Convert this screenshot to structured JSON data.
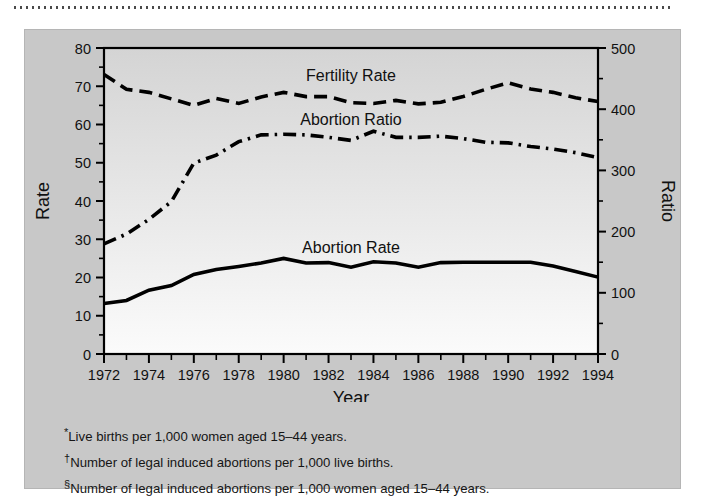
{
  "figure": {
    "panel_color": "#c8c8c8",
    "plot_gradient_top": "#d4d4d4",
    "plot_gradient_bottom": "#fbfbfb",
    "line_color": "#000000"
  },
  "footnotes": [
    {
      "marker": "*",
      "text": "Live births per 1,000 women aged 15–44 years."
    },
    {
      "marker": "†",
      "text": "Number of legal induced abortions per 1,000 live births."
    },
    {
      "marker": "§",
      "text": "Number of legal induced abortions per 1,000 women aged 15–44 years."
    }
  ],
  "chart_data": {
    "type": "line",
    "title": "",
    "xlabel": "Year",
    "ylabel": "Rate",
    "y2label": "Ratio",
    "xlim": [
      1972,
      1994
    ],
    "ylim": [
      0,
      80
    ],
    "y2lim": [
      0,
      500
    ],
    "grid": false,
    "legend": "inline-labels",
    "x": [
      1972,
      1973,
      1974,
      1975,
      1976,
      1977,
      1978,
      1979,
      1980,
      1981,
      1982,
      1983,
      1984,
      1985,
      1986,
      1987,
      1988,
      1989,
      1990,
      1991,
      1992,
      1993,
      1994
    ],
    "xticks": [
      1972,
      1974,
      1976,
      1978,
      1980,
      1982,
      1984,
      1986,
      1988,
      1990,
      1992,
      1994
    ],
    "xtick_labels": [
      "1972",
      "1974",
      "1976",
      "1978",
      "1980",
      "1982",
      "1984",
      "1986",
      "1988",
      "1990",
      "1992",
      "1994"
    ],
    "xminor_ticks": [
      1973,
      1975,
      1977,
      1979,
      1981,
      1983,
      1985,
      1987,
      1989,
      1991,
      1993
    ],
    "yticks": [
      0,
      10,
      20,
      30,
      40,
      50,
      60,
      70,
      80
    ],
    "ytick_labels": [
      "0",
      "10",
      "20",
      "30",
      "40",
      "50",
      "60",
      "70",
      "80"
    ],
    "y2ticks": [
      0,
      100,
      200,
      300,
      400,
      500
    ],
    "y2tick_labels": [
      "0",
      "100",
      "200",
      "300",
      "400",
      "500"
    ],
    "y2minor_ticks": [
      50,
      150,
      250,
      350,
      450
    ],
    "series": [
      {
        "name": "Fertility Rate",
        "label": "Fertility Rate",
        "axis": "left",
        "style": "dashed",
        "label_x": 1983.0,
        "label_y": 73.0,
        "values": [
          73.1,
          69.2,
          68.4,
          66.7,
          65.0,
          66.8,
          65.5,
          67.2,
          68.4,
          67.3,
          67.3,
          65.7,
          65.5,
          66.3,
          65.4,
          65.8,
          67.3,
          69.2,
          70.9,
          69.3,
          68.4,
          67.0,
          66.0
        ]
      },
      {
        "name": "Abortion Ratio",
        "label": "Abortion Ratio",
        "axis": "right",
        "style": "dashdot",
        "label_x": 1983.0,
        "label_y": 61.5,
        "values": [
          180,
          196,
          220,
          249,
          312,
          325,
          347,
          358,
          359,
          358,
          354,
          349,
          364,
          354,
          354,
          356,
          352,
          346,
          345,
          339,
          335,
          329,
          321
        ]
      },
      {
        "name": "Abortion Rate",
        "label": "Abortion Rate",
        "axis": "left",
        "style": "solid",
        "label_x": 1983.0,
        "label_y": 28.0,
        "values": [
          13.2,
          14.0,
          16.7,
          17.9,
          20.8,
          22.1,
          22.9,
          23.8,
          25.0,
          23.8,
          23.9,
          22.7,
          24.1,
          23.8,
          22.7,
          23.9,
          24.0,
          24.0,
          24.0,
          24.0,
          23.0,
          21.6,
          20.1
        ]
      }
    ]
  }
}
